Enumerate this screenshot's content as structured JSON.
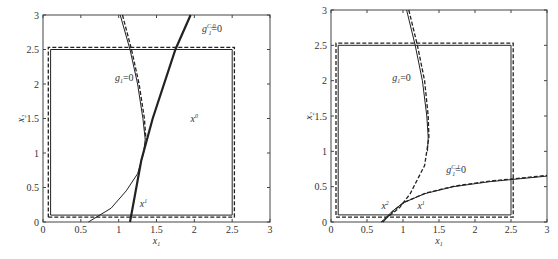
{
  "chart_data": [
    {
      "type": "line",
      "panel": "left",
      "xlabel": "x1",
      "ylabel": "x2",
      "xlim": [
        0,
        3
      ],
      "ylim": [
        0,
        3
      ],
      "xticks": [
        "0",
        "0.5",
        "1",
        "1.5",
        "2",
        "2.5",
        "3"
      ],
      "yticks": [
        "0",
        "0.5",
        "1",
        "1.5",
        "2",
        "2.5",
        "3"
      ],
      "grid": false,
      "annotations": [
        {
          "text": "g1=0",
          "x": 0.95,
          "y": 2.05
        },
        {
          "text": "g1^{C,0}=0",
          "x": 2.1,
          "y": 2.75
        },
        {
          "text": "x^0",
          "x": 1.95,
          "y": 1.45
        },
        {
          "text": "x^1",
          "x": 1.28,
          "y": 0.22
        }
      ],
      "series": [
        {
          "name": "feasible box (solid)",
          "style": "solid",
          "points": [
            [
              0.1,
              0.1
            ],
            [
              2.5,
              0.1
            ],
            [
              2.5,
              2.5
            ],
            [
              0.1,
              2.5
            ],
            [
              0.1,
              0.1
            ]
          ]
        },
        {
          "name": "feasible box (dashed)",
          "style": "dashed",
          "points": [
            [
              0.07,
              0.07
            ],
            [
              2.53,
              0.07
            ],
            [
              2.53,
              2.53
            ],
            [
              0.07,
              2.53
            ],
            [
              0.07,
              0.07
            ]
          ]
        },
        {
          "name": "g1=0 (solid)",
          "style": "solid",
          "points": [
            [
              1.02,
              3.0
            ],
            [
              1.15,
              2.5
            ],
            [
              1.25,
              2.0
            ],
            [
              1.32,
              1.5
            ],
            [
              1.35,
              1.2
            ],
            [
              1.33,
              1.0
            ],
            [
              1.25,
              0.7
            ],
            [
              1.1,
              0.45
            ],
            [
              0.9,
              0.2
            ],
            [
              0.6,
              0.0
            ]
          ]
        },
        {
          "name": "g1=0 (dashed)",
          "style": "dashed",
          "points": [
            [
              1.05,
              3.0
            ],
            [
              1.17,
              2.5
            ],
            [
              1.27,
              2.0
            ],
            [
              1.34,
              1.5
            ],
            [
              1.36,
              1.2
            ]
          ]
        },
        {
          "name": "g1^{C,0}=0",
          "style": "solid-bold",
          "points": [
            [
              1.15,
              0.0
            ],
            [
              1.3,
              0.9
            ],
            [
              1.45,
              1.5
            ],
            [
              1.75,
              2.5
            ],
            [
              1.95,
              3.0
            ]
          ]
        }
      ]
    },
    {
      "type": "line",
      "panel": "right",
      "xlabel": "x1",
      "ylabel": "x2",
      "xlim": [
        0,
        3
      ],
      "ylim": [
        0,
        3
      ],
      "xticks": [
        "0",
        "0.5",
        "1",
        "1.5",
        "2",
        "2.5",
        "3"
      ],
      "yticks": [
        "0",
        "0.5",
        "1",
        "1.5",
        "2",
        "2.5",
        "3"
      ],
      "grid": false,
      "annotations": [
        {
          "text": "g1=0",
          "x": 0.85,
          "y": 2.0
        },
        {
          "text": "g1^{C,1}=0",
          "x": 1.6,
          "y": 0.7
        },
        {
          "text": "x^2",
          "x": 0.7,
          "y": 0.18
        },
        {
          "text": "x^1",
          "x": 1.2,
          "y": 0.18
        }
      ],
      "series": [
        {
          "name": "feasible box (solid)",
          "style": "solid",
          "points": [
            [
              0.1,
              0.1
            ],
            [
              2.5,
              0.1
            ],
            [
              2.5,
              2.5
            ],
            [
              0.1,
              2.5
            ],
            [
              0.1,
              0.1
            ]
          ]
        },
        {
          "name": "feasible box (dashed)",
          "style": "dashed",
          "points": [
            [
              0.07,
              0.07
            ],
            [
              2.53,
              0.07
            ],
            [
              2.53,
              2.53
            ],
            [
              0.07,
              2.53
            ],
            [
              0.07,
              0.07
            ]
          ]
        },
        {
          "name": "g1=0 (solid)",
          "style": "solid",
          "points": [
            [
              1.05,
              3.0
            ],
            [
              1.17,
              2.5
            ],
            [
              1.27,
              2.0
            ],
            [
              1.33,
              1.5
            ],
            [
              1.35,
              1.2
            ],
            [
              1.34,
              1.0
            ]
          ]
        },
        {
          "name": "g1=0 (dashed)",
          "style": "dashed",
          "points": [
            [
              1.08,
              3.0
            ],
            [
              1.2,
              2.5
            ],
            [
              1.3,
              2.0
            ],
            [
              1.35,
              1.5
            ],
            [
              1.36,
              1.2
            ],
            [
              1.3,
              0.8
            ],
            [
              1.1,
              0.4
            ],
            [
              0.95,
              0.2
            ],
            [
              0.7,
              0.0
            ]
          ]
        },
        {
          "name": "g1^{C,1}=0 (solid)",
          "style": "solid",
          "points": [
            [
              0.7,
              0.0
            ],
            [
              0.85,
              0.15
            ],
            [
              1.0,
              0.27
            ],
            [
              1.3,
              0.4
            ],
            [
              1.7,
              0.5
            ],
            [
              2.2,
              0.57
            ],
            [
              2.5,
              0.6
            ],
            [
              3.0,
              0.65
            ]
          ]
        },
        {
          "name": "g1^{C,1}=0 (dashed)",
          "style": "dashed",
          "points": [
            [
              0.72,
              0.0
            ],
            [
              0.87,
              0.16
            ],
            [
              1.02,
              0.28
            ],
            [
              1.32,
              0.41
            ],
            [
              1.72,
              0.51
            ],
            [
              2.22,
              0.58
            ],
            [
              2.52,
              0.61
            ],
            [
              3.0,
              0.66
            ]
          ]
        }
      ]
    }
  ]
}
